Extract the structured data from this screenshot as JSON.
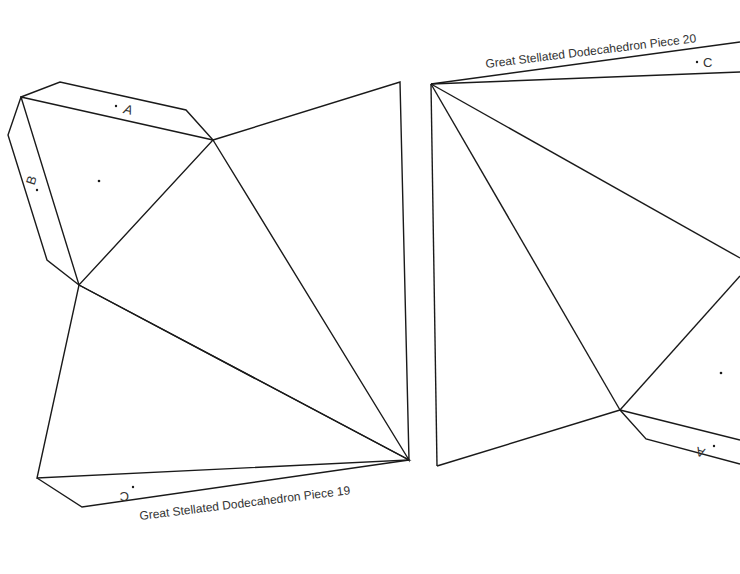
{
  "pieces": [
    {
      "title": "Great Stellated Dodecahedron Piece 19",
      "tabs": {
        "a": "A",
        "b": "B",
        "c": "C"
      }
    },
    {
      "title": "Great Stellated Dodecahedron Piece 20",
      "tabs": {
        "a": "A",
        "c": "C"
      }
    }
  ],
  "colors": {
    "line": "#1a1a1a",
    "text": "#333333",
    "background": "#ffffff"
  }
}
